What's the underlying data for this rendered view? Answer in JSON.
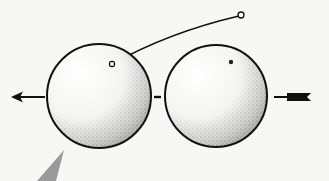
{
  "diagram": {
    "title": "",
    "colors": {
      "background": "#f7f7f5",
      "stroke": "#111111",
      "stipple": "#555555",
      "pointer": "#9a9a9a"
    },
    "spheres": [
      {
        "name": "left-sphere",
        "cx": 99,
        "cy": 96,
        "r": 52,
        "marker": {
          "cx": 112,
          "cy": 64,
          "type": "open-circle"
        }
      },
      {
        "name": "right-sphere",
        "cx": 216,
        "cy": 96,
        "r": 51,
        "marker": {
          "cx": 231,
          "cy": 62,
          "type": "dot"
        }
      }
    ],
    "connector": {
      "from": [
        149,
        97
      ],
      "to": [
        167,
        97
      ]
    },
    "lead_line": {
      "from": [
        112,
        64
      ],
      "to": [
        241,
        15
      ],
      "end_marker": "open-circle"
    },
    "arrows": [
      {
        "name": "left-arrow",
        "direction": "left",
        "from": [
          45,
          97
        ],
        "to": [
          12,
          97
        ]
      },
      {
        "name": "right-arrow-tail",
        "direction": "left",
        "from": [
          311,
          97
        ],
        "to": [
          274,
          97
        ],
        "style": "fletched"
      }
    ],
    "pointer": {
      "name": "gray-pointer",
      "points": [
        [
          37,
          181
        ],
        [
          64,
          150
        ],
        [
          56,
          181
        ]
      ]
    }
  }
}
